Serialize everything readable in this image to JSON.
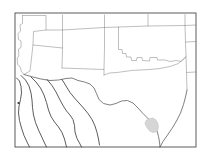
{
  "figure": {
    "kind": "reference-outline-map",
    "title": "",
    "caption": "",
    "background_color": "#ffffff",
    "frame_color": "#4a4a4a",
    "state_line_color": "#8a8a8a",
    "international_line_color": "#3f3f3f",
    "highlight_fill_color": "#d6d6d6",
    "width_px": 209,
    "height_px": 162
  },
  "frame": {
    "x": 15,
    "y": 13,
    "width": 181,
    "height": 134
  },
  "regions": {
    "countries": [
      "United States",
      "Mexico"
    ],
    "us_states_shown": [
      "California",
      "Nevada",
      "Utah",
      "Arizona",
      "New Mexico",
      "Colorado",
      "Kansas",
      "Oklahoma",
      "Texas",
      "Missouri",
      "Arkansas",
      "Louisiana"
    ],
    "mexico_states_shown": [
      "Baja California",
      "Sonora",
      "Chihuahua",
      "Coahuila"
    ]
  },
  "highlight": {
    "label": "shaded-county",
    "description": "small gray shaded area on the south Texas Gulf coast",
    "fill": "#d6d6d6",
    "centroid_x": 153,
    "centroid_y": 125
  },
  "marker": {
    "label": "point-marker",
    "x": 18.5,
    "y": 103,
    "color": "#333333",
    "radius": 1.1
  },
  "paths": {
    "us_state_borders": [
      "M 22.5 15.5 L 22.5 23.5 L 20.0 25.0 L 20.5 31.0 L 18.0 33.5 L 18.5 39.5 L 21.0 41.0 L 21.0 47.5 L 18.5 49.0 L 18.8 56.0 L 17.2 58.0 L 17.6 64.5 L 20.0 66.5 L 21.5 71.5 L 24.0 74.5",
      "M 22.5 15.5 L 46.0 15.5 L 46.0 30.0 L 62.5 30.0",
      "M 46.0 30.0 L 33.5 31.5 L 33.0 45.0 L 31.5 58.0 L 30.0 71.0 L 24.0 74.5",
      "M 62.5 15.0 L 62.5 30.0 L 62.5 48.0 L 62.0 68.0",
      "M 62.5 30.0 L 104.5 27.5",
      "M 104.5 15.0 L 104.5 27.5 L 104.5 48.0 L 104.0 69.5",
      "M 62.0 68.0 L 104.0 69.5 L 104.0 75.0",
      "M 33.0 45.0 L 62.5 48.0",
      "M 104.5 27.5 L 148.0 26.0 L 148.0 14.5",
      "M 148.0 26.0 L 185.0 25.5",
      "M 185.0 14.5 L 185.0 25.5 L 185.5 42.0 L 186.0 56.0 L 186.5 72.5 L 187.0 90.0",
      "M 185.0 25.5 L 196.0 25.0",
      "M 185.5 42.0 L 196.0 41.5",
      "M 186.5 72.5 L 196.0 72.0",
      "M 118.5 27.0 L 118.5 49.5 L 122.0 49.5 L 122.5 53.5 L 126.0 53.5 L 126.5 57.0 L 131.0 57.0 L 131.5 60.5 L 136.5 60.5 L 137.0 57.5 L 142.0 57.5 L 142.5 60.5 L 149.5 61.0 L 150.0 57.5 L 157.0 57.5 L 157.5 60.0 L 165.0 60.0 L 170.0 61.5 L 176.0 60.5 L 181.0 61.5 L 185.8 57.0",
      "M 104.0 75.0 L 109.5 73.0 L 117.0 72.5 L 124.0 71.5 L 131.5 70.5 L 140.0 70.0 L 150.0 69.5 L 160.0 68.5 L 170.0 66.5 L 178.5 63.5 L 185.8 57.0"
    ],
    "mexico_us_border": "M 24.0 74.5 L 33.0 77.0 L 41.0 79.0 L 50.0 80.5 L 58.5 80.0 L 66.0 78.5 L 72.0 78.0 L 78.0 80.5 L 84.5 82.0 L 90.0 84.0 L 94.0 88.0 L 96.5 93.5 L 99.0 99.5 L 103.5 103.5 L 110.0 105.0 L 116.0 103.5 L 121.5 101.0 L 127.5 100.5 L 133.0 103.0 L 138.0 108.0 L 143.0 113.5 L 147.5 118.0 L 151.5 122.0 L 155.0 126.5 L 157.0 131.0 L 158.5 136.5 L 159.5 142.0 L 160.0 147.0",
    "texas_gulf_coast": "M 160.0 147.0 L 163.0 141.5 L 167.5 135.0 L 172.0 128.5 L 176.5 121.0 L 180.5 113.0 L 183.5 104.5 L 185.5 97.0 L 187.0 90.0",
    "mexico_internal_borders": [
      "M 16.5 78.0 L 19.5 81.0 L 21.0 86.5 L 21.5 93.0 L 20.5 99.5 L 19.0 106.0 L 18.5 113.0 L 19.5 120.5 L 21.5 128.0 L 24.0 135.5 L 27.0 142.0 L 29.5 147.0",
      "M 21.0 75.5 L 25.5 80.0 L 29.0 86.0 L 31.0 93.0 L 32.0 100.0 L 32.5 107.5 L 33.5 115.0 L 35.5 122.5 L 38.5 130.0 L 42.0 137.5 L 45.0 144.0 L 46.5 147.0",
      "M 31.0 77.0 L 36.0 82.0 L 40.5 88.0 L 44.0 95.0 L 46.5 102.5 L 48.5 110.0 L 51.0 116.5 L 54.5 122.0 L 58.5 127.0 L 62.0 132.5 L 64.5 139.0 L 66.0 145.0 L 66.5 147.0",
      "M 47.0 79.5 L 52.0 85.5 L 56.0 92.0 L 59.5 99.0 L 63.0 105.5 L 66.5 111.0 L 70.0 115.0 L 73.0 119.5 L 74.5 125.5 L 75.0 132.0 L 77.0 138.5 L 80.0 144.0 L 81.5 147.0",
      "M 62.0 79.5 L 66.0 86.0 L 70.0 92.5 L 74.5 98.0 L 79.0 103.0 L 83.5 108.0 L 88.0 113.5 L 92.0 119.5 L 95.0 126.0 L 97.0 132.5 L 98.5 139.0 L 99.5 145.0"
    ],
    "highlight_polygon": "M 146.0 120.5 L 149.5 118.5 L 153.0 118.0 L 155.5 119.5 L 157.5 122.5 L 158.5 126.0 L 158.0 129.5 L 156.0 132.0 L 152.5 132.5 L 149.0 130.5 L 146.5 127.0 L 145.0 123.5 Z"
  }
}
